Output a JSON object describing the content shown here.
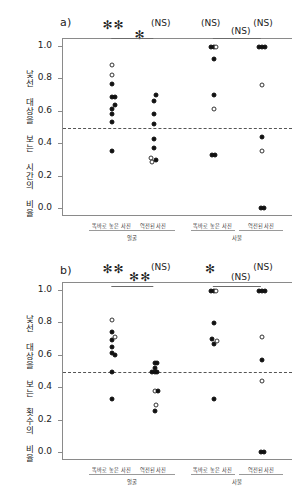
{
  "figure": {
    "background": "#ffffff",
    "point_fill_color": "#111111",
    "point_open_color": "#ffffff",
    "axis_color": "#8a8a8a",
    "midline_value": 0.5
  },
  "panels": [
    {
      "id": "a",
      "label": "a)",
      "ylabel": "낯선 대상을 보는 시간의 비율",
      "yticks": [
        "1.0",
        "0.8",
        "0.6",
        "0.4",
        "0.2",
        "0.0"
      ],
      "ytick_values": [
        1.0,
        0.8,
        0.6,
        0.4,
        0.2,
        0.0
      ],
      "xcats": [
        "똑바로 놓은 사진",
        "역전된 사진",
        "똑바로 놓은 사진",
        "역전된 사진"
      ],
      "xgroups": [
        "얼굴",
        "사물"
      ],
      "annotations": [
        "✻✻",
        "✻",
        "(NS)",
        "(NS)",
        "(NS)",
        "(NS)"
      ]
    },
    {
      "id": "b",
      "label": "b)",
      "ylabel": "낯선 대상을 보는 횟수의 비율",
      "yticks": [
        "1.0",
        "0.8",
        "0.6",
        "0.4",
        "0.2",
        "0.0"
      ],
      "ytick_values": [
        1.0,
        0.8,
        0.6,
        0.4,
        0.2,
        0.0
      ],
      "xcats": [
        "똑바로 놓은 사진",
        "역전된 사진",
        "똑바로 놓은 사진",
        "역전된 사진"
      ],
      "xgroups": [
        "얼굴",
        "사물"
      ],
      "annotations": [
        "✻✻",
        "✻✻",
        "(NS)",
        "✻",
        "(NS)",
        "(NS)"
      ]
    }
  ],
  "chart_data": [
    {
      "type": "scatter",
      "panel": "a",
      "title": "a)",
      "xlabel": "",
      "ylabel": "낯선 대상을 보는 시간의 비율",
      "ylim": [
        0.0,
        1.0
      ],
      "yticks": [
        0.0,
        0.2,
        0.4,
        0.6,
        0.8,
        1.0
      ],
      "grid": false,
      "legend": "none",
      "reference_line": 0.5,
      "reference_line_style": "dashed",
      "categories": [
        "똑바로 놓은 사진 (얼굴)",
        "역전된 사진 (얼굴)",
        "똑바로 놓은 사진 (사물)",
        "역전된 사진 (사물)"
      ],
      "significance": [
        {
          "label": "✻✻",
          "spans": "얼굴 똑바로 vs chance"
        },
        {
          "label": "✻",
          "spans": "얼굴 똑바로 vs 얼굴 역전"
        },
        {
          "label": "(NS)",
          "spans": "얼굴 역전 vs chance"
        },
        {
          "label": "(NS)",
          "spans": "사물 똑바로 vs chance"
        },
        {
          "label": "(NS)",
          "spans": "사물 똑바로 vs 사물 역전"
        },
        {
          "label": "(NS)",
          "spans": "사물 역전 vs chance"
        }
      ],
      "series": [
        {
          "name": "똑바로 놓은 사진 (얼굴)",
          "points": [
            {
              "x": 0.0,
              "y": 0.89,
              "marker": "open"
            },
            {
              "x": 0.0,
              "y": 0.83,
              "marker": "open"
            },
            {
              "x": 0.0,
              "y": 0.77,
              "marker": "filled"
            },
            {
              "x": -0.02,
              "y": 0.69,
              "marker": "filled"
            },
            {
              "x": 0.06,
              "y": 0.69,
              "marker": "filled"
            },
            {
              "x": 0.05,
              "y": 0.645,
              "marker": "filled"
            },
            {
              "x": -0.01,
              "y": 0.615,
              "marker": "filled"
            },
            {
              "x": -0.02,
              "y": 0.585,
              "marker": "filled"
            },
            {
              "x": -0.02,
              "y": 0.535,
              "marker": "filled"
            },
            {
              "x": -0.02,
              "y": 0.355,
              "marker": "filled"
            }
          ]
        },
        {
          "name": "역전된 사진 (얼굴)",
          "points": [
            {
              "x": 0.05,
              "y": 0.705,
              "marker": "filled"
            },
            {
              "x": 0.0,
              "y": 0.665,
              "marker": "filled"
            },
            {
              "x": 0.0,
              "y": 0.585,
              "marker": "filled"
            },
            {
              "x": 0.0,
              "y": 0.525,
              "marker": "filled"
            },
            {
              "x": 0.0,
              "y": 0.43,
              "marker": "filled"
            },
            {
              "x": 0.0,
              "y": 0.375,
              "marker": "filled"
            },
            {
              "x": -0.06,
              "y": 0.315,
              "marker": "open"
            },
            {
              "x": -0.03,
              "y": 0.29,
              "marker": "open"
            },
            {
              "x": 0.04,
              "y": 0.305,
              "marker": "filled"
            }
          ]
        },
        {
          "name": "똑바로 놓은 사진 (사물)",
          "points": [
            {
              "x": -0.06,
              "y": 1.0,
              "marker": "filled"
            },
            {
              "x": 0.0,
              "y": 1.0,
              "marker": "filled"
            },
            {
              "x": 0.06,
              "y": 1.0,
              "marker": "open"
            },
            {
              "x": 0.0,
              "y": 0.925,
              "marker": "filled"
            },
            {
              "x": 0.0,
              "y": 0.705,
              "marker": "filled"
            },
            {
              "x": 0.0,
              "y": 0.615,
              "marker": "open"
            },
            {
              "x": -0.03,
              "y": 0.335,
              "marker": "filled"
            },
            {
              "x": 0.04,
              "y": 0.335,
              "marker": "filled"
            }
          ]
        },
        {
          "name": "역전된 사진 (사물)",
          "points": [
            {
              "x": -0.06,
              "y": 1.0,
              "marker": "filled"
            },
            {
              "x": 0.0,
              "y": 1.0,
              "marker": "filled"
            },
            {
              "x": 0.06,
              "y": 1.0,
              "marker": "filled"
            },
            {
              "x": 0.0,
              "y": 0.765,
              "marker": "open"
            },
            {
              "x": 0.0,
              "y": 0.445,
              "marker": "filled"
            },
            {
              "x": 0.0,
              "y": 0.355,
              "marker": "open"
            },
            {
              "x": -0.03,
              "y": 0.005,
              "marker": "filled"
            },
            {
              "x": 0.04,
              "y": 0.005,
              "marker": "filled"
            }
          ]
        }
      ]
    },
    {
      "type": "scatter",
      "panel": "b",
      "title": "b)",
      "xlabel": "",
      "ylabel": "낯선 대상을 보는 횟수의 비율",
      "ylim": [
        0.0,
        1.0
      ],
      "yticks": [
        0.0,
        0.2,
        0.4,
        0.6,
        0.8,
        1.0
      ],
      "grid": false,
      "legend": "none",
      "reference_line": 0.5,
      "reference_line_style": "dashed",
      "categories": [
        "똑바로 놓은 사진 (얼굴)",
        "역전된 사진 (얼굴)",
        "똑바로 놓은 사진 (사물)",
        "역전된 사진 (사물)"
      ],
      "significance": [
        {
          "label": "✻✻",
          "spans": "얼굴 똑바로 vs chance"
        },
        {
          "label": "✻✻",
          "spans": "얼굴 똑바로 vs 얼굴 역전"
        },
        {
          "label": "(NS)",
          "spans": "얼굴 역전 vs chance"
        },
        {
          "label": "✻",
          "spans": "사물 똑바로 vs chance"
        },
        {
          "label": "(NS)",
          "spans": "사물 똑바로 vs 사물 역전"
        },
        {
          "label": "(NS)",
          "spans": "사물 역전 vs chance"
        }
      ],
      "series": [
        {
          "name": "똑바로 놓은 사진 (얼굴)",
          "points": [
            {
              "x": 0.0,
              "y": 0.82,
              "marker": "open"
            },
            {
              "x": -0.02,
              "y": 0.745,
              "marker": "filled"
            },
            {
              "x": -0.02,
              "y": 0.695,
              "marker": "filled"
            },
            {
              "x": 0.06,
              "y": 0.715,
              "marker": "open"
            },
            {
              "x": -0.02,
              "y": 0.655,
              "marker": "filled"
            },
            {
              "x": -0.02,
              "y": 0.62,
              "marker": "filled"
            },
            {
              "x": 0.05,
              "y": 0.605,
              "marker": "filled"
            },
            {
              "x": -0.02,
              "y": 0.5,
              "marker": "filled"
            },
            {
              "x": -0.02,
              "y": 0.335,
              "marker": "filled"
            }
          ]
        },
        {
          "name": "역전된 사진 (얼굴)",
          "points": [
            {
              "x": 0.02,
              "y": 0.555,
              "marker": "filled"
            },
            {
              "x": 0.07,
              "y": 0.555,
              "marker": "filled"
            },
            {
              "x": 0.02,
              "y": 0.525,
              "marker": "filled"
            },
            {
              "x": -0.05,
              "y": 0.5,
              "marker": "filled"
            },
            {
              "x": 0.02,
              "y": 0.5,
              "marker": "filled"
            },
            {
              "x": 0.07,
              "y": 0.5,
              "marker": "filled"
            },
            {
              "x": 0.02,
              "y": 0.385,
              "marker": "open"
            },
            {
              "x": 0.08,
              "y": 0.385,
              "marker": "filled"
            },
            {
              "x": 0.05,
              "y": 0.295,
              "marker": "open"
            },
            {
              "x": 0.02,
              "y": 0.26,
              "marker": "filled"
            }
          ]
        },
        {
          "name": "똑바로 놓은 사진 (사물)",
          "points": [
            {
              "x": -0.06,
              "y": 1.0,
              "marker": "filled"
            },
            {
              "x": 0.0,
              "y": 1.0,
              "marker": "filled"
            },
            {
              "x": 0.06,
              "y": 1.0,
              "marker": "open"
            },
            {
              "x": 0.0,
              "y": 0.805,
              "marker": "filled"
            },
            {
              "x": -0.04,
              "y": 0.705,
              "marker": "filled"
            },
            {
              "x": 0.01,
              "y": 0.675,
              "marker": "filled"
            },
            {
              "x": 0.07,
              "y": 0.69,
              "marker": "open"
            },
            {
              "x": 0.0,
              "y": 0.335,
              "marker": "filled"
            }
          ]
        },
        {
          "name": "역전된 사진 (사물)",
          "points": [
            {
              "x": -0.06,
              "y": 1.0,
              "marker": "filled"
            },
            {
              "x": 0.0,
              "y": 1.0,
              "marker": "filled"
            },
            {
              "x": 0.06,
              "y": 1.0,
              "marker": "filled"
            },
            {
              "x": 0.0,
              "y": 0.715,
              "marker": "open"
            },
            {
              "x": 0.0,
              "y": 0.575,
              "marker": "filled"
            },
            {
              "x": 0.0,
              "y": 0.445,
              "marker": "open"
            },
            {
              "x": -0.03,
              "y": 0.005,
              "marker": "filled"
            },
            {
              "x": 0.04,
              "y": 0.005,
              "marker": "filled"
            }
          ]
        }
      ]
    }
  ]
}
